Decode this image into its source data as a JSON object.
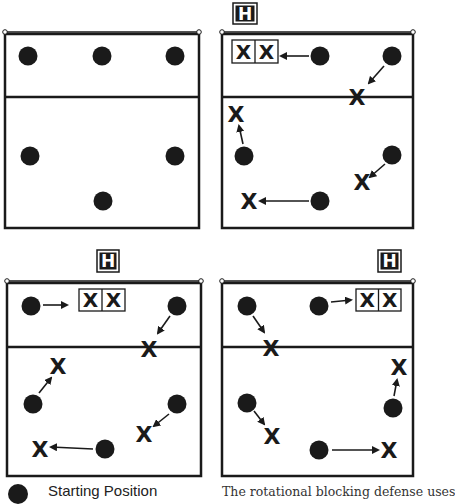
{
  "colors": {
    "ink": "#1a1a1a",
    "paper": "#ffffff",
    "frame": "#2a2a2a"
  },
  "symbols": {
    "player_marker": "filled-circle",
    "blocker_label": "X",
    "hitter_label": "H"
  },
  "diagrams": [
    {
      "id": "top-left",
      "court": {
        "x1": 5,
        "y1": 34,
        "x2": 199,
        "y2": 228,
        "attack_line_y": 97
      },
      "hitter": null,
      "double_block": null,
      "players": [
        {
          "cx": 28,
          "cy": 56
        },
        {
          "cx": 102,
          "cy": 56
        },
        {
          "cx": 175,
          "cy": 56
        },
        {
          "cx": 30,
          "cy": 156
        },
        {
          "cx": 175,
          "cy": 156
        },
        {
          "cx": 103,
          "cy": 201
        }
      ],
      "moves": []
    },
    {
      "id": "top-right",
      "court": {
        "x1": 222,
        "y1": 34,
        "x2": 413,
        "y2": 228,
        "attack_line_y": 97
      },
      "hitter": {
        "x": 233,
        "y": 3,
        "w": 24,
        "h": 21,
        "label": "H"
      },
      "double_block": {
        "x": 232,
        "y": 40,
        "w": 46,
        "h": 23,
        "labels": [
          "X",
          "X"
        ]
      },
      "players": [
        {
          "cx": 320,
          "cy": 56
        },
        {
          "cx": 392,
          "cy": 56
        },
        {
          "cx": 244,
          "cy": 156
        },
        {
          "cx": 392,
          "cy": 155
        },
        {
          "cx": 320,
          "cy": 201
        }
      ],
      "moves": [
        {
          "from": [
            309,
            56
          ],
          "to": [
            281,
            56
          ],
          "x_at": null
        },
        {
          "from": [
            384,
            66
          ],
          "to": [
            369,
            83
          ],
          "x_at": [
            357,
            97
          ]
        },
        {
          "from": [
            243,
            144
          ],
          "to": [
            239,
            126
          ],
          "x_at": [
            236,
            114
          ]
        },
        {
          "from": [
            385,
            164
          ],
          "to": [
            370,
            177
          ],
          "x_at": [
            362,
            182
          ]
        },
        {
          "from": [
            309,
            201
          ],
          "to": [
            260,
            201
          ],
          "x_at": [
            249,
            201
          ]
        }
      ]
    },
    {
      "id": "bottom-left",
      "court": {
        "x1": 7,
        "y1": 283,
        "x2": 201,
        "y2": 476,
        "attack_line_y": 347
      },
      "hitter": {
        "x": 97,
        "y": 250,
        "w": 22,
        "h": 22,
        "label": "H"
      },
      "double_block": {
        "x": 79,
        "y": 289,
        "w": 46,
        "h": 22,
        "labels": [
          "X",
          "X"
        ]
      },
      "players": [
        {
          "cx": 31,
          "cy": 306
        },
        {
          "cx": 177,
          "cy": 306
        },
        {
          "cx": 33,
          "cy": 404
        },
        {
          "cx": 177,
          "cy": 404
        },
        {
          "cx": 105,
          "cy": 449
        }
      ],
      "moves": [
        {
          "from": [
            43,
            305
          ],
          "to": [
            67,
            305
          ],
          "x_at": null
        },
        {
          "from": [
            170,
            316
          ],
          "to": [
            158,
            333
          ],
          "x_at": [
            149,
            349
          ]
        },
        {
          "from": [
            39,
            393
          ],
          "to": [
            51,
            378
          ],
          "x_at": [
            58,
            366
          ]
        },
        {
          "from": [
            169,
            414
          ],
          "to": [
            154,
            426
          ],
          "x_at": [
            144,
            434
          ]
        },
        {
          "from": [
            93,
            449
          ],
          "to": [
            51,
            447
          ],
          "x_at": [
            40,
            449
          ]
        }
      ]
    },
    {
      "id": "bottom-right",
      "court": {
        "x1": 222,
        "y1": 283,
        "x2": 413,
        "y2": 476,
        "attack_line_y": 347
      },
      "hitter": {
        "x": 378,
        "y": 250,
        "w": 23,
        "h": 22,
        "label": "H"
      },
      "double_block": {
        "x": 356,
        "y": 289,
        "w": 45,
        "h": 22,
        "labels": [
          "X",
          "X"
        ]
      },
      "players": [
        {
          "cx": 247,
          "cy": 306
        },
        {
          "cx": 319,
          "cy": 306
        },
        {
          "cx": 247,
          "cy": 403
        },
        {
          "cx": 393,
          "cy": 408
        },
        {
          "cx": 319,
          "cy": 450
        }
      ],
      "moves": [
        {
          "from": [
            331,
            302
          ],
          "to": [
            351,
            300
          ],
          "x_at": null
        },
        {
          "from": [
            253,
            316
          ],
          "to": [
            264,
            332
          ],
          "x_at": [
            271,
            348
          ]
        },
        {
          "from": [
            394,
            396
          ],
          "to": [
            397,
            380
          ],
          "x_at": [
            399,
            367
          ]
        },
        {
          "from": [
            254,
            411
          ],
          "to": [
            264,
            424
          ],
          "x_at": [
            272,
            436
          ]
        },
        {
          "from": [
            332,
            450
          ],
          "to": [
            378,
            450
          ],
          "x_at": [
            389,
            450
          ]
        }
      ]
    }
  ],
  "legend": {
    "starting_position_label": "Starting Position"
  },
  "caption": {
    "text": "The rotational blocking defense uses"
  }
}
